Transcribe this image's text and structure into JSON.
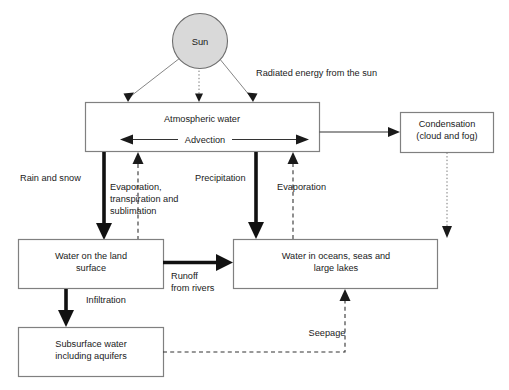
{
  "diagram": {
    "nodes": [
      {
        "id": "sun",
        "label": "Sun",
        "shape": "circle",
        "fill": "#d9d9d9"
      },
      {
        "id": "atmospheric-water",
        "label": "Atmospheric water",
        "shape": "rect"
      },
      {
        "id": "advection",
        "label": "Advection",
        "shape": "arrow-label"
      },
      {
        "id": "condensation",
        "label_line1": "Condensation",
        "label_line2": "(cloud and fog)",
        "shape": "rect"
      },
      {
        "id": "water-on-land",
        "label_line1": "Water on the land",
        "label_line2": "surface",
        "shape": "rect"
      },
      {
        "id": "water-in-oceans",
        "label_line1": "Water in oceans, seas and",
        "label_line2": "large lakes",
        "shape": "rect"
      },
      {
        "id": "subsurface-water",
        "label_line1": "Subsurface water",
        "label_line2": "including aquifers",
        "shape": "rect"
      }
    ],
    "edges": [
      {
        "id": "radiated-energy",
        "label": "Radiated energy from the sun",
        "style": "thin-ray",
        "from": "sun",
        "to": "atmospheric-water"
      },
      {
        "id": "rain-and-snow",
        "label": "Rain and snow",
        "style": "thick",
        "from": "atmospheric-water",
        "to": "water-on-land"
      },
      {
        "id": "evaporation-transpiration-sublimation",
        "label_line1": "Evaporation,",
        "label_line2": "transpiration and",
        "label_line3": "sublimation",
        "style": "dashed",
        "from": "water-on-land",
        "to": "atmospheric-water"
      },
      {
        "id": "precipitation",
        "label": "Precipitation",
        "style": "thick",
        "from": "atmospheric-water",
        "to": "water-in-oceans"
      },
      {
        "id": "evaporation",
        "label": "Evaporation",
        "style": "dashed",
        "from": "water-in-oceans",
        "to": "atmospheric-water"
      },
      {
        "id": "atmospheric-to-condensation",
        "label": "",
        "style": "thin",
        "from": "atmospheric-water",
        "to": "condensation"
      },
      {
        "id": "condensation-to-oceans",
        "label": "",
        "style": "dotted",
        "from": "condensation",
        "to": "water-in-oceans"
      },
      {
        "id": "runoff-from-rivers",
        "label_line1": "Runoff",
        "label_line2": "from rivers",
        "style": "thick",
        "from": "water-on-land",
        "to": "water-in-oceans"
      },
      {
        "id": "infiltration",
        "label": "Infiltration",
        "style": "thick",
        "from": "water-on-land",
        "to": "subsurface-water"
      },
      {
        "id": "seepage",
        "label": "Seepage",
        "style": "dashed",
        "from": "subsurface-water",
        "to": "water-in-oceans"
      }
    ]
  }
}
